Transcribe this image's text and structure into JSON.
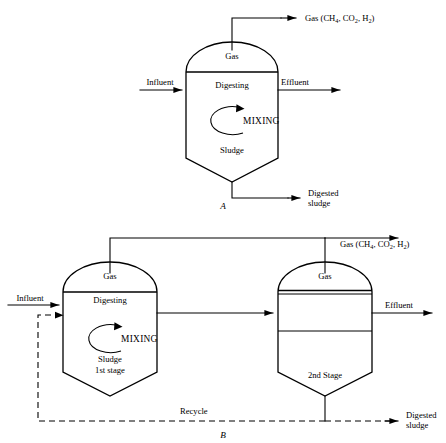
{
  "figure": {
    "panels": [
      {
        "caption": "A",
        "name": "single-stage-digester",
        "vessel_labels": [
          "Gas",
          "Digesting",
          "MIXING",
          "Sludge"
        ],
        "streams": {
          "gas_out": "Gas (CH",
          "gas_out_sub1": "4",
          "gas_out_mid": ", CO",
          "gas_out_sub2": "2",
          "gas_out_mid2": ", H",
          "gas_out_sub3": "2",
          "gas_out_end": ")",
          "influent": "Influent",
          "effluent": "Effluent",
          "digested_sludge_line1": "Digested",
          "digested_sludge_line2": "sludge"
        }
      },
      {
        "caption": "B",
        "name": "two-stage-digester",
        "stage1_labels": [
          "Gas",
          "Digesting",
          "MIXING",
          "Sludge",
          "1st stage"
        ],
        "stage2_labels": [
          "Gas",
          "2nd Stage"
        ],
        "streams": {
          "gas_out": "Gas (CH",
          "gas_out_sub1": "4",
          "gas_out_mid": ", CO",
          "gas_out_sub2": "2",
          "gas_out_mid2": ", H",
          "gas_out_sub3": "2",
          "gas_out_end": ")",
          "influent": "Influent",
          "effluent": "Effluent",
          "recycle": "Recycle",
          "digested_sludge_line1": "Digested",
          "digested_sludge_line2": "sludge"
        }
      }
    ]
  },
  "colors": {
    "line": "#000000",
    "background": "#ffffff",
    "text": "#000000"
  }
}
